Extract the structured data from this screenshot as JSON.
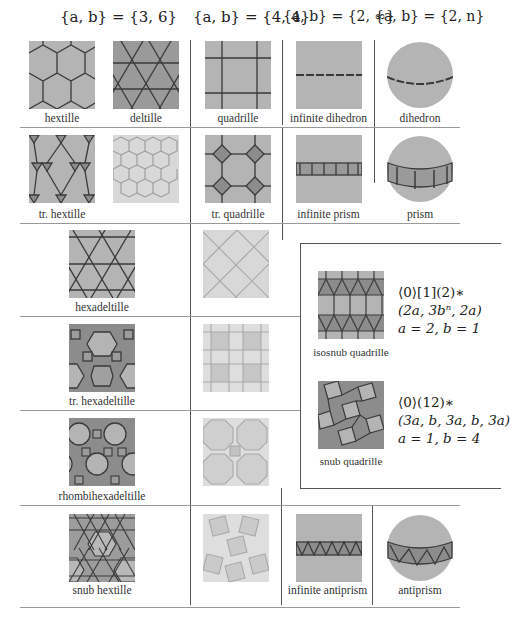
{
  "headers": {
    "col_36": "{a, b} = {3, 6}",
    "col_44": "{a, b} = {4, 4}",
    "col_2inf": "{a, b} = {2, ∞}",
    "col_2n": "{a, b} = {2, n}"
  },
  "rows": [
    {
      "labels": [
        "hextille",
        "deltille",
        "quadrille",
        "infinite dihedron",
        "dihedron"
      ]
    },
    {
      "labels": [
        "tr. hextille",
        "",
        "tr. quadrille",
        "infinite prism",
        "prism"
      ]
    },
    {
      "labels": [
        "hexadeltille",
        ""
      ]
    },
    {
      "labels": [
        "tr. hexadeltille",
        ""
      ]
    },
    {
      "labels": [
        "rhombihexadeltille",
        ""
      ]
    },
    {
      "labels": [
        "snub hextille",
        "",
        "infinite antiprism",
        "antiprism"
      ]
    }
  ],
  "inset": {
    "isosnub": {
      "label": "isosnub quadrille",
      "line1": "⟨0⟩[1](2)∗",
      "line2": "(2a, 3bⁿ, 2a)",
      "line3": "a = 2, b = 1"
    },
    "snub": {
      "label": "snub quadrille",
      "line1": "⟨0⟩(12)∗",
      "line2": "(3a, b, 3a, b, 3a)",
      "line3": "a = 1, b = 4"
    }
  },
  "colors": {
    "tile_mid": "#b4b4b4",
    "tile_dark": "#8c8c8c",
    "tile_light": "#d8d8d8",
    "tile_pale": "#e6e6e6",
    "edge_dark": "#3a3a3a",
    "edge_light": "#9a9a9a"
  }
}
